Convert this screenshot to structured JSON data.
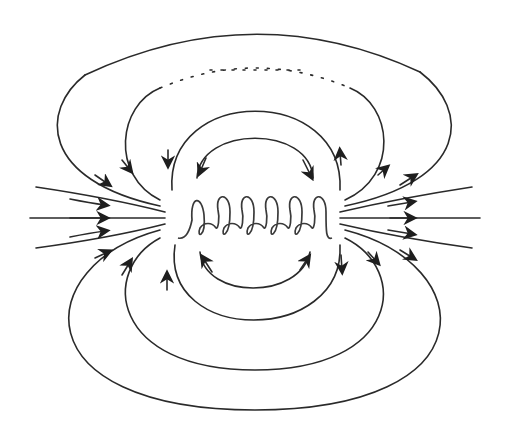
{
  "diagram": {
    "coil_turns": 6,
    "field_line_count": {
      "axial_left": 5,
      "axial_right": 5,
      "upper_loops": 4,
      "lower_loops": 4
    },
    "arrow_direction": "left-to-right along axis; loops return from right end back to left end",
    "colors": {
      "background": "#ffffff",
      "line": "#2a2a2a"
    }
  }
}
